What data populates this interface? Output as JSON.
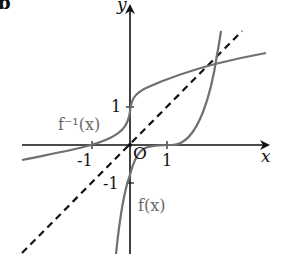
{
  "figure": {
    "corner_label": "b",
    "axes": {
      "x_label": "x",
      "y_label": "y",
      "origin_label": "O",
      "x_ticks": [
        "-1",
        "1"
      ],
      "y_ticks": [
        "1",
        "-1"
      ]
    },
    "curves": [
      {
        "name": "f(x)",
        "label": "f(x)",
        "color": "#707070",
        "style": "solid"
      },
      {
        "name": "f_inverse",
        "label": "f⁻¹(x)",
        "color": "#707070",
        "style": "solid"
      },
      {
        "name": "y_equals_x",
        "label": "",
        "color": "#111111",
        "style": "dashed"
      }
    ],
    "colors": {
      "axis": "#111111",
      "curve": "#707070",
      "text": "#111111",
      "curve_label": "#6a6a6a"
    }
  }
}
